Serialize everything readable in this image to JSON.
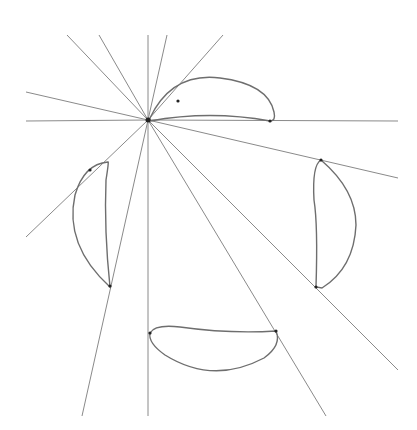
{
  "diagram": {
    "background": "#ffffff",
    "line_color": "#8a8a8a",
    "curve_color": "#6e6e6e",
    "center": [
      148,
      120
    ],
    "rays": [
      {
        "to": [
          67,
          35
        ]
      },
      {
        "to": [
          99,
          35
        ]
      },
      {
        "to": [
          148,
          35
        ]
      },
      {
        "to": [
          167,
          35
        ]
      },
      {
        "to": [
          223,
          35
        ]
      },
      {
        "to": [
          26,
          92
        ]
      },
      {
        "to": [
          26,
          121
        ]
      },
      {
        "to": [
          398,
          121
        ]
      },
      {
        "to": [
          398,
          178
        ]
      },
      {
        "to": [
          26,
          237
        ]
      },
      {
        "to": [
          82,
          416
        ]
      },
      {
        "to": [
          148,
          416
        ]
      },
      {
        "to": [
          326,
          416
        ]
      },
      {
        "to": [
          398,
          370
        ]
      }
    ],
    "crescents": [
      {
        "name": "top",
        "d": "M150,118 Q172,72 220,78 Q268,84 274,112 Q276,121 270,121 Q210,110 150,121 Z",
        "dots": [
          [
            178,
            101
          ],
          [
            270,
            121
          ]
        ]
      },
      {
        "name": "right",
        "d": "M321,160 Q356,190 356,225 Q354,268 322,288 L316,287 Q318,225 314,200 Q312,165 321,160 Z",
        "dots": [
          [
            321,
            160
          ],
          [
            316,
            287
          ]
        ]
      },
      {
        "name": "left",
        "d": "M108,162 Q84,164 75,195 Q64,245 110,287 Q104,230 106,180 Q109,161 108,162 Z",
        "dots": [
          [
            90,
            170
          ],
          [
            110,
            286
          ]
        ]
      },
      {
        "name": "bottom",
        "d": "M150,333 Q155,324 180,327 Q230,334 276,331 Q282,345 264,358 Q213,385 165,355 Q148,343 150,333 Z",
        "dots": [
          [
            150,
            333
          ],
          [
            276,
            331
          ]
        ]
      }
    ]
  }
}
